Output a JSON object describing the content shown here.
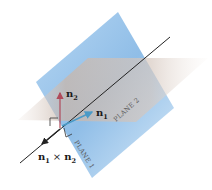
{
  "diagram": {
    "labels": {
      "n1": "n",
      "n1_sub": "1",
      "n2": "n",
      "n2_sub": "2",
      "cross_n1": "n",
      "cross_n1_sub": "1",
      "cross_op": "×",
      "cross_n2": "n",
      "cross_n2_sub": "2",
      "plane1": "PLANE 1",
      "plane2": "PLANE 2"
    },
    "colors": {
      "plane1": "#7fb4e6",
      "plane2": "#c9b9ae",
      "n1_vector": "#4a9ac7",
      "n2_vector": "#b04a5a",
      "line": "#222222"
    }
  }
}
